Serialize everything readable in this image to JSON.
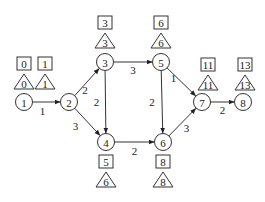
{
  "diagram": {
    "type": "activity-network",
    "nodes": [
      {
        "id": "1",
        "label": "1",
        "x": 24,
        "y": 102,
        "early": "0",
        "late": "0",
        "box_pos": "above"
      },
      {
        "id": "2",
        "label": "2",
        "x": 69,
        "y": 102,
        "early": "1",
        "late": "1",
        "box_pos": "above-left"
      },
      {
        "id": "3",
        "label": "3",
        "x": 105,
        "y": 62,
        "early": "3",
        "late": "3",
        "box_pos": "above"
      },
      {
        "id": "4",
        "label": "4",
        "x": 106,
        "y": 142,
        "early": "5",
        "late": "6",
        "box_pos": "below"
      },
      {
        "id": "5",
        "label": "5",
        "x": 161,
        "y": 62,
        "early": "6",
        "late": "6",
        "box_pos": "above"
      },
      {
        "id": "6",
        "label": "6",
        "x": 163,
        "y": 142,
        "early": "8",
        "late": "8",
        "box_pos": "below"
      },
      {
        "id": "7",
        "label": "7",
        "x": 202,
        "y": 102,
        "early": "11",
        "late": "11",
        "box_pos": "above-right"
      },
      {
        "id": "8",
        "label": "8",
        "x": 243,
        "y": 102,
        "early": "13",
        "late": "13",
        "box_pos": "above"
      }
    ],
    "edges": [
      {
        "from": "1",
        "to": "2",
        "weight": "1"
      },
      {
        "from": "2",
        "to": "3",
        "weight": "2"
      },
      {
        "from": "2",
        "to": "4",
        "weight": "3"
      },
      {
        "from": "3",
        "to": "5",
        "weight": "3"
      },
      {
        "from": "3",
        "to": "4",
        "weight": "2"
      },
      {
        "from": "4",
        "to": "6",
        "weight": "2"
      },
      {
        "from": "5",
        "to": "6",
        "weight": "2"
      },
      {
        "from": "5",
        "to": "7",
        "weight": "1"
      },
      {
        "from": "6",
        "to": "7",
        "weight": "3"
      },
      {
        "from": "7",
        "to": "8",
        "weight": "2"
      }
    ],
    "legend": {
      "square": "earliest time",
      "triangle": "latest time"
    },
    "colors": {
      "stroke": "#333333",
      "text": "#222222",
      "background": "#ffffff"
    }
  }
}
